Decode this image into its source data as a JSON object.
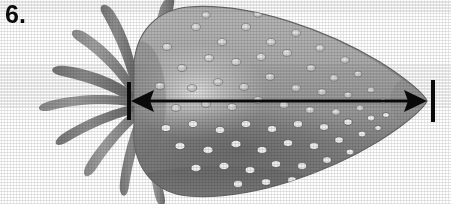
{
  "figure": {
    "item_number": "6.",
    "view": "side-profile-pointing-right",
    "style": "grayscale-halftone-line-illustration",
    "background_color": "#ffffff"
  },
  "measurement": {
    "annotation_type": "double-headed-dimension-arrow",
    "orientation": "horizontal",
    "label": "",
    "arrow_color": "#0a0a0a",
    "line": {
      "x_start": 131,
      "x_end": 426,
      "y": 101,
      "thickness_px": 3
    },
    "left_arrowhead": {
      "x_tip": 131,
      "x_base": 152,
      "direction": "left"
    },
    "right_arrowhead": {
      "x_tip": 426,
      "x_base": 405,
      "direction": "right"
    },
    "end_ticks": [
      {
        "name": "left-tick",
        "x": 129,
        "y_top": 82,
        "y_bottom": 120
      },
      {
        "name": "right-tick",
        "x": 433,
        "y_top": 80,
        "y_bottom": 122
      }
    ]
  },
  "fruit": {
    "name": "strawberry-body",
    "shape": "teardrop-cone-pointing-right",
    "bounds": {
      "left": 133,
      "right": 427,
      "top": 4,
      "bottom": 200
    },
    "upper_tone": "#ababab",
    "lower_tone": "#7d7d7d",
    "highlight_tone": "#dcdcdc",
    "edge_tone": "#636363",
    "seed_count": 96,
    "seed_highlight_color": "#efefef",
    "seed_shadow_color": "#5c5c5c"
  },
  "calyx": {
    "name": "sepal-cluster",
    "position": "left-end-of-fruit",
    "sepal_count": 9,
    "fill_tone": "#9b9b9b",
    "dark_tone": "#6e6e6e",
    "sepals": [
      {
        "name": "sepal-1-upper-right",
        "angle_deg": -78,
        "length": 96,
        "width": 17
      },
      {
        "name": "sepal-2-upper",
        "angle_deg": -56,
        "length": 104,
        "width": 18
      },
      {
        "name": "sepal-3-upper-left",
        "angle_deg": -33,
        "length": 112,
        "width": 18
      },
      {
        "name": "sepal-4-left-upper",
        "angle_deg": -14,
        "length": 118,
        "width": 17
      },
      {
        "name": "sepal-5-left",
        "angle_deg": 4,
        "length": 120,
        "width": 17
      },
      {
        "name": "sepal-6-left-lower",
        "angle_deg": 24,
        "length": 116,
        "width": 17
      },
      {
        "name": "sepal-7-lower-left",
        "angle_deg": 44,
        "length": 108,
        "width": 17
      },
      {
        "name": "sepal-8-lower",
        "angle_deg": 64,
        "length": 100,
        "width": 17
      },
      {
        "name": "sepal-9-lower-right",
        "angle_deg": 84,
        "length": 92,
        "width": 16
      }
    ]
  }
}
